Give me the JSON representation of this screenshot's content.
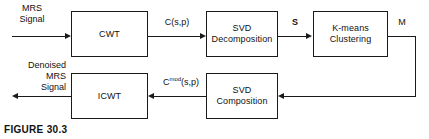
{
  "figure": {
    "caption": "FIGURE 30.3",
    "type": "block-diagram",
    "background_color": "#ffffff",
    "stroke_color": "#1a1a1a"
  },
  "blocks": [
    {
      "id": "cwt",
      "label": "CWT"
    },
    {
      "id": "svd-decomposition",
      "label": "SVD\nDecomposition"
    },
    {
      "id": "kmeans-clustering",
      "label": "K-means\nClustering"
    },
    {
      "id": "svd-composition",
      "label": "SVD\nComposition"
    },
    {
      "id": "icwt",
      "label": "ICWT"
    }
  ],
  "signals": {
    "input": "MRS\nSignal",
    "output": "Denoised\nMRS\nSignal",
    "cwt_to_svd": "C(s,p)",
    "svd_to_kmeans": "S",
    "kmeans_out": "M",
    "svdcomp_to_icwt_base": "C",
    "svdcomp_to_icwt_sup": "mod",
    "svdcomp_to_icwt_tail": "(s,p)"
  }
}
